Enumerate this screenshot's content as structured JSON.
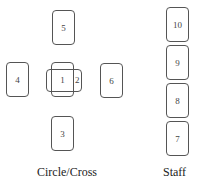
{
  "diagram": {
    "type": "tarot-spread-layout",
    "groups": [
      {
        "label": "Circle/Cross",
        "cards": [
          {
            "id": "1",
            "label": "1",
            "orientation": "vertical"
          },
          {
            "id": "2",
            "label": "2",
            "orientation": "horizontal",
            "crosses": "1"
          },
          {
            "id": "3",
            "label": "3",
            "orientation": "vertical",
            "position": "below"
          },
          {
            "id": "4",
            "label": "4",
            "orientation": "vertical",
            "position": "left"
          },
          {
            "id": "5",
            "label": "5",
            "orientation": "vertical",
            "position": "above"
          },
          {
            "id": "6",
            "label": "6",
            "orientation": "vertical",
            "position": "right"
          }
        ]
      },
      {
        "label": "Staff",
        "cards": [
          {
            "id": "10",
            "label": "10"
          },
          {
            "id": "9",
            "label": "9"
          },
          {
            "id": "8",
            "label": "8"
          },
          {
            "id": "7",
            "label": "7"
          }
        ]
      }
    ]
  }
}
